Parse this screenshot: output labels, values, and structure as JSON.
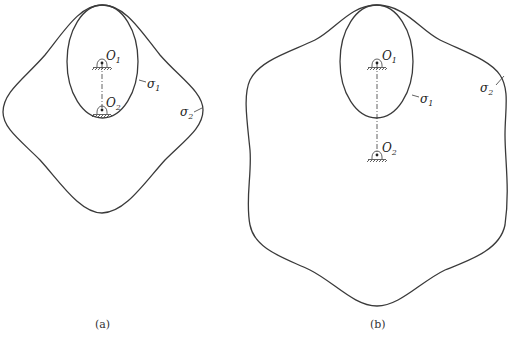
{
  "figure": {
    "panels": [
      {
        "id": "a",
        "caption": "(a)",
        "pivots": [
          {
            "label": "O",
            "sub": "1"
          },
          {
            "label": "O",
            "sub": "2"
          }
        ],
        "curves": [
          {
            "label": "σ",
            "sub": "1"
          },
          {
            "label": "σ",
            "sub": "2"
          }
        ]
      },
      {
        "id": "b",
        "caption": "(b)",
        "pivots": [
          {
            "label": "O",
            "sub": "1"
          },
          {
            "label": "O",
            "sub": "2"
          }
        ],
        "curves": [
          {
            "label": "σ",
            "sub": "1"
          },
          {
            "label": "σ",
            "sub": "2"
          }
        ]
      }
    ]
  }
}
